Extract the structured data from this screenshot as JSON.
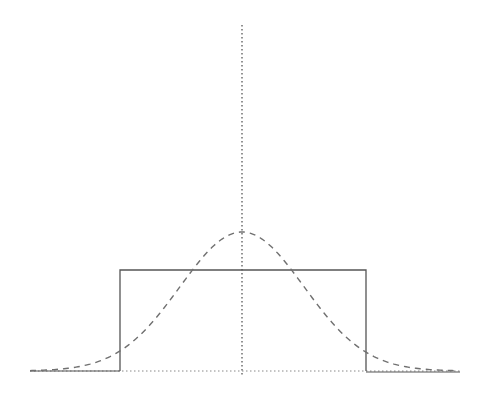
{
  "figure": {
    "colors": {
      "background": "#ffffff",
      "line": "#555555",
      "dashed": "#707070",
      "dotted": "#888888"
    },
    "center_axis": {
      "x": 242,
      "y_top": 25,
      "y_bottom": 375,
      "style": "dotted"
    },
    "baseline": {
      "y": 371,
      "x_left": 30,
      "x_right": 460,
      "style": "dotted"
    },
    "rectangle": {
      "x_left": 120,
      "x_right": 366,
      "y_top": 270,
      "y_bottom": 371,
      "style": "solid"
    },
    "gaussian": {
      "center_x": 242,
      "peak_y": 232,
      "baseline_y": 371,
      "sigma_px": 62,
      "x_min": 30,
      "x_max": 458,
      "style": "dashed"
    }
  }
}
